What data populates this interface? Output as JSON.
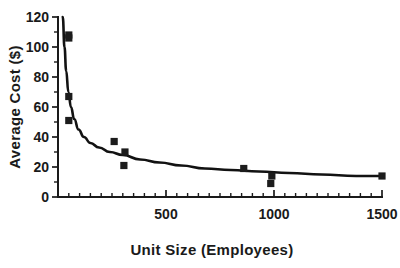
{
  "chart_data": {
    "type": "scatter",
    "title": "",
    "xlabel": "Unit Size (Employees)",
    "ylabel": "Average Cost ($)",
    "xlim": [
      0,
      1500
    ],
    "ylim": [
      0,
      120
    ],
    "grid": false,
    "legend": null,
    "x_tick_labels": [
      "500",
      "1000",
      "1500"
    ],
    "x_tick_values": [
      500,
      1000,
      1500
    ],
    "x_minor_tick_step": 50,
    "y_tick_labels": [
      "0",
      "20",
      "40",
      "60",
      "80",
      "100",
      "120"
    ],
    "y_tick_values": [
      0,
      20,
      40,
      60,
      80,
      100,
      120
    ],
    "y_minor_tick_step": 10,
    "marker_style": "filled-square",
    "marker_color": "#1c1c1c",
    "curve_color": "#121212",
    "points": [
      {
        "x": 50,
        "y": 108
      },
      {
        "x": 50,
        "y": 106
      },
      {
        "x": 50,
        "y": 67
      },
      {
        "x": 50,
        "y": 51
      },
      {
        "x": 260,
        "y": 37
      },
      {
        "x": 310,
        "y": 30
      },
      {
        "x": 305,
        "y": 21
      },
      {
        "x": 860,
        "y": 19
      },
      {
        "x": 985,
        "y": 9
      },
      {
        "x": 990,
        "y": 14
      },
      {
        "x": 1500,
        "y": 14
      }
    ],
    "fit_curve": {
      "description": "decreasing hyperbolic fit",
      "points": [
        {
          "x": 22,
          "y": 120
        },
        {
          "x": 30,
          "y": 100
        },
        {
          "x": 38,
          "y": 84
        },
        {
          "x": 48,
          "y": 70
        },
        {
          "x": 60,
          "y": 60
        },
        {
          "x": 75,
          "y": 52
        },
        {
          "x": 95,
          "y": 45
        },
        {
          "x": 120,
          "y": 40
        },
        {
          "x": 150,
          "y": 36
        },
        {
          "x": 190,
          "y": 33
        },
        {
          "x": 240,
          "y": 30
        },
        {
          "x": 300,
          "y": 28
        },
        {
          "x": 380,
          "y": 25
        },
        {
          "x": 470,
          "y": 23
        },
        {
          "x": 570,
          "y": 21
        },
        {
          "x": 680,
          "y": 19
        },
        {
          "x": 800,
          "y": 18
        },
        {
          "x": 930,
          "y": 17
        },
        {
          "x": 1070,
          "y": 16
        },
        {
          "x": 1220,
          "y": 15
        },
        {
          "x": 1380,
          "y": 14
        },
        {
          "x": 1500,
          "y": 14
        }
      ]
    }
  }
}
